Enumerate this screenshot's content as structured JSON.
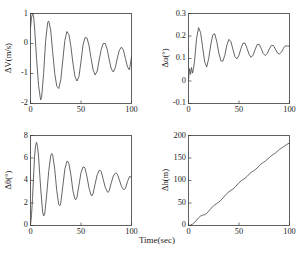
{
  "scan_artifact": {
    "clipped_caption_fragment": "図 数値シミュレーション結果 縦運動の時間応答"
  },
  "figure": {
    "shared_xlabel": "Time(sec)",
    "panel_count": 4
  },
  "chart_data": [
    {
      "type": "line",
      "panel": "top-left",
      "title": "",
      "xlabel": "Time(sec)",
      "ylabel": "ΔV(m/s)",
      "xlim": [
        0,
        100
      ],
      "ylim": [
        -2,
        1
      ],
      "xticks": [
        0,
        50,
        100
      ],
      "xtick_labels": [
        "0",
        "50",
        "100"
      ],
      "yticks": [
        -2,
        -1,
        0,
        1
      ],
      "ytick_labels": [
        "-2",
        "-1",
        "0",
        "1"
      ],
      "grid": false,
      "legend": null,
      "series": [
        {
          "name": "ΔV",
          "x": [
            0,
            1,
            2,
            3,
            4,
            6,
            8,
            10,
            11,
            13,
            15,
            17,
            18,
            20,
            22,
            24,
            26,
            28,
            30,
            32,
            34,
            36,
            38,
            40,
            42,
            44,
            46,
            48,
            50,
            52,
            54,
            56,
            58,
            60,
            62,
            64,
            66,
            68,
            70,
            72,
            74,
            76,
            78,
            80,
            82,
            84,
            86,
            88,
            90,
            92,
            94,
            96,
            98,
            100
          ],
          "values": [
            0.52,
            0.86,
            1.0,
            0.92,
            0.55,
            -0.5,
            -1.4,
            -1.88,
            -1.8,
            -1.0,
            0.1,
            0.7,
            0.75,
            0.45,
            -0.3,
            -1.0,
            -1.42,
            -1.5,
            -1.2,
            -0.55,
            0.1,
            0.4,
            0.3,
            -0.1,
            -0.65,
            -1.1,
            -1.25,
            -1.1,
            -0.6,
            -0.05,
            0.2,
            0.18,
            -0.08,
            -0.5,
            -0.88,
            -1.05,
            -0.92,
            -0.55,
            -0.2,
            0.0,
            0.0,
            -0.2,
            -0.55,
            -0.85,
            -0.95,
            -0.8,
            -0.48,
            -0.22,
            -0.12,
            -0.22,
            -0.5,
            -0.78,
            -0.88,
            -0.45
          ]
        }
      ]
    },
    {
      "type": "line",
      "panel": "top-right",
      "title": "",
      "xlabel": "Time(sec)",
      "ylabel": "Δα(°)",
      "xlim": [
        0,
        100
      ],
      "ylim": [
        -0.1,
        0.3
      ],
      "xticks": [
        0,
        50,
        100
      ],
      "xtick_labels": [
        "0",
        "50",
        "100"
      ],
      "yticks": [
        -0.1,
        0,
        0.1,
        0.2,
        0.3
      ],
      "ytick_labels": [
        "-0.1",
        "0",
        "0.1",
        "0.2",
        "0.3"
      ],
      "grid": false,
      "legend": null,
      "series": [
        {
          "name": "Δα",
          "x": [
            0,
            1,
            2,
            3,
            4,
            5,
            6,
            8,
            10,
            12,
            14,
            16,
            18,
            20,
            22,
            24,
            26,
            28,
            30,
            32,
            34,
            36,
            38,
            40,
            42,
            44,
            46,
            48,
            50,
            52,
            54,
            56,
            58,
            60,
            62,
            64,
            66,
            68,
            70,
            72,
            74,
            76,
            78,
            80,
            82,
            84,
            86,
            88,
            90,
            92,
            94,
            96,
            98,
            100
          ],
          "values": [
            0.0,
            0.055,
            0.03,
            0.06,
            0.035,
            0.055,
            0.09,
            0.19,
            0.237,
            0.215,
            0.15,
            0.085,
            0.062,
            0.1,
            0.16,
            0.205,
            0.21,
            0.175,
            0.125,
            0.09,
            0.088,
            0.115,
            0.16,
            0.185,
            0.175,
            0.14,
            0.108,
            0.098,
            0.115,
            0.145,
            0.168,
            0.168,
            0.145,
            0.118,
            0.105,
            0.115,
            0.14,
            0.162,
            0.163,
            0.145,
            0.122,
            0.113,
            0.122,
            0.142,
            0.158,
            0.158,
            0.142,
            0.125,
            0.12,
            0.128,
            0.145,
            0.157,
            0.155,
            0.155
          ]
        }
      ]
    },
    {
      "type": "line",
      "panel": "bottom-left",
      "title": "",
      "xlabel": "Time(sec)",
      "ylabel": "Δθ(°)",
      "xlim": [
        0,
        100
      ],
      "ylim": [
        0,
        8
      ],
      "xticks": [
        0,
        50,
        100
      ],
      "xtick_labels": [
        "0",
        "50",
        "100"
      ],
      "yticks": [
        0,
        2,
        4,
        6,
        8
      ],
      "ytick_labels": [
        "0",
        "2",
        "4",
        "6",
        "8"
      ],
      "grid": false,
      "legend": null,
      "series": [
        {
          "name": "Δθ",
          "x": [
            0,
            1,
            2,
            3,
            4,
            5,
            6,
            7,
            8,
            10,
            12,
            13,
            14,
            16,
            18,
            20,
            21,
            22,
            24,
            26,
            28,
            29,
            30,
            32,
            34,
            36,
            37,
            38,
            40,
            42,
            44,
            45,
            46,
            48,
            50,
            52,
            53,
            54,
            56,
            58,
            60,
            61,
            62,
            64,
            66,
            68,
            69,
            70,
            72,
            74,
            76,
            77,
            78,
            80,
            82,
            84,
            85,
            86,
            88,
            90,
            92,
            93,
            94,
            96,
            98,
            100
          ],
          "values": [
            0.05,
            0.9,
            2.4,
            4.3,
            6.1,
            7.1,
            7.4,
            7.0,
            6.1,
            3.4,
            1.2,
            0.85,
            1.0,
            2.7,
            4.8,
            6.2,
            6.4,
            6.25,
            5.0,
            3.1,
            1.85,
            1.75,
            2.0,
            3.5,
            5.0,
            5.7,
            5.7,
            5.5,
            4.5,
            3.1,
            2.35,
            2.3,
            2.5,
            3.6,
            4.7,
            5.2,
            5.2,
            5.1,
            4.3,
            3.3,
            2.7,
            2.65,
            2.85,
            3.7,
            4.5,
            4.9,
            4.9,
            4.8,
            4.1,
            3.4,
            3.0,
            2.95,
            3.1,
            3.8,
            4.4,
            4.65,
            4.65,
            4.55,
            4.05,
            3.5,
            3.2,
            3.2,
            3.3,
            3.9,
            4.35,
            4.3
          ]
        }
      ]
    },
    {
      "type": "line",
      "panel": "bottom-right",
      "title": "",
      "xlabel": "Time(sec)",
      "ylabel": "Δh(m)",
      "xlim": [
        0,
        100
      ],
      "ylim": [
        0,
        200
      ],
      "xticks": [
        0,
        50,
        100
      ],
      "xtick_labels": [
        "0",
        "50",
        "100"
      ],
      "yticks": [
        0,
        50,
        100,
        150,
        200
      ],
      "ytick_labels": [
        "0",
        "50",
        "100",
        "150",
        "200"
      ],
      "grid": false,
      "legend": null,
      "series": [
        {
          "name": "Δh",
          "x": [
            0,
            2,
            4,
            6,
            8,
            10,
            12,
            14,
            16,
            18,
            20,
            22,
            24,
            26,
            28,
            30,
            32,
            34,
            36,
            38,
            40,
            42,
            44,
            46,
            48,
            50,
            52,
            54,
            56,
            58,
            60,
            62,
            64,
            66,
            68,
            70,
            72,
            74,
            76,
            78,
            80,
            82,
            84,
            86,
            88,
            90,
            92,
            94,
            96,
            98,
            100
          ],
          "values": [
            0,
            1,
            3,
            7,
            12,
            17,
            21,
            23,
            24,
            27,
            32,
            37,
            42,
            46,
            49,
            52,
            56,
            61,
            66,
            71,
            75,
            78,
            81,
            85,
            90,
            95,
            99,
            102,
            105,
            109,
            114,
            118,
            121,
            124,
            128,
            133,
            137,
            140,
            143,
            147,
            151,
            155,
            158,
            161,
            165,
            169,
            172,
            175,
            178,
            181,
            183
          ]
        }
      ]
    }
  ],
  "colors": {
    "background": "#ffffff",
    "axis": "#3a3a3a",
    "curve": "#4a4a4a",
    "text": "#1a1a1a"
  }
}
